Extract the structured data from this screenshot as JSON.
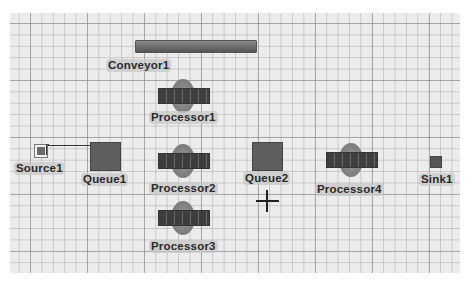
{
  "view": {
    "type": "3D model view",
    "grid": {
      "minor_spacing_px": 11.4,
      "major_every": 5
    }
  },
  "objects": [
    {
      "id": "conveyor1",
      "type": "conveyor",
      "label": "Conveyor1"
    },
    {
      "id": "processor1",
      "type": "processor",
      "label": "Processor1"
    },
    {
      "id": "source1",
      "type": "source",
      "label": "Source1"
    },
    {
      "id": "queue1",
      "type": "queue",
      "label": "Queue1"
    },
    {
      "id": "processor2",
      "type": "processor",
      "label": "Processor2"
    },
    {
      "id": "processor3",
      "type": "processor",
      "label": "Processor3"
    },
    {
      "id": "queue2",
      "type": "queue",
      "label": "Queue2"
    },
    {
      "id": "processor4",
      "type": "processor",
      "label": "Processor4"
    },
    {
      "id": "sink1",
      "type": "sink",
      "label": "Sink1"
    }
  ],
  "connections": [
    {
      "from": "Source1",
      "to": "Queue1"
    }
  ],
  "cursor": {
    "icon": "crosshair-cursor-icon"
  },
  "colors": {
    "background": "#ececec",
    "object_dark": "#5e5e5e",
    "label_bg": "#c8c8c8"
  }
}
